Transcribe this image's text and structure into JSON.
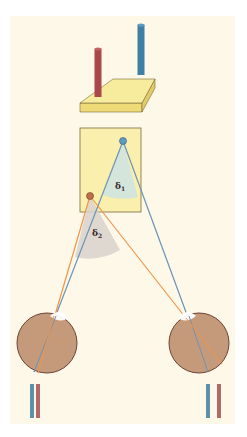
{
  "diagram": {
    "type": "stereopsis-binocular-disparity",
    "labels": {
      "angle_1": "δ",
      "angle_1_sub": "1",
      "angle_2": "δ",
      "angle_2_sub": "2"
    },
    "colors": {
      "background_panel": "#fdf8e8",
      "platform_top": "#f7ec9e",
      "platform_side": "#eedb78",
      "card": "#faefad",
      "red_rod": "#a9474b",
      "blue_rod": "#3f7fa3",
      "red_ray": "#f0954a",
      "blue_ray": "#6d93b8",
      "angle_1_wedge": "#cfe3e0",
      "angle_2_wedge": "#d9d2cb",
      "eye": "#c59a7a",
      "eye_outline": "#6b4236",
      "cornea": "#ffffff",
      "retina_bar_blue": "#5d8fa7",
      "retina_bar_red": "#b06868"
    },
    "objects": {
      "near_point": "red",
      "far_point": "blue"
    },
    "retinal_images": {
      "left_eye": [
        "blue",
        "red"
      ],
      "right_eye": [
        "blue",
        "red"
      ]
    }
  }
}
